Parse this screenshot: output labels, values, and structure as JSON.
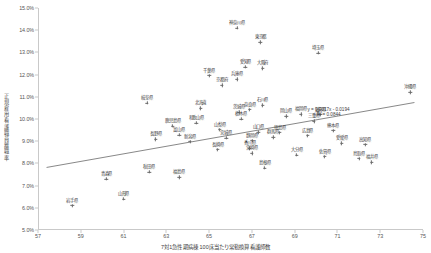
{
  "chart_data": {
    "type": "scatter",
    "title": "",
    "xlabel": "7対1急性期病棟 100床当たり常勤換算看護師数",
    "ylabel": "正規雇用看護職員離職率",
    "xlim": [
      57,
      75
    ],
    "ylim": [
      0.05,
      0.15
    ],
    "xticks": [
      "57",
      "59",
      "61",
      "63",
      "65",
      "67",
      "69",
      "71",
      "73",
      "75"
    ],
    "xtick_values": [
      57,
      59,
      61,
      63,
      65,
      67,
      69,
      71,
      73,
      75
    ],
    "yticks": [
      "5.0%",
      "6.0%",
      "7.0%",
      "8.0%",
      "9.0%",
      "10.0%",
      "11.0%",
      "12.0%",
      "13.0%",
      "14.0%",
      "15.0%"
    ],
    "ytick_values": [
      0.05,
      0.06,
      0.07,
      0.08,
      0.09,
      0.1,
      0.11,
      0.12,
      0.13,
      0.14,
      0.15
    ],
    "grid": false,
    "legend": "none",
    "marker": "cross",
    "marker_color": "#6b6b6b",
    "trendline": {
      "equation": "y = 0.0017x - 0.0194",
      "r_squared": "R² = 0.0844",
      "slope": 0.0017,
      "intercept": -0.0194,
      "color": "#555555",
      "x_start": 57.4,
      "x_end": 74.6
    },
    "points": [
      {
        "label": "神奈川県",
        "x": 66.3,
        "y": 0.141
      },
      {
        "label": "東京都",
        "x": 67.4,
        "y": 0.1345
      },
      {
        "label": "埼玉県",
        "x": 70.1,
        "y": 0.1298
      },
      {
        "label": "愛知県",
        "x": 66.7,
        "y": 0.1235
      },
      {
        "label": "大阪府",
        "x": 67.5,
        "y": 0.1228
      },
      {
        "label": "千葉県",
        "x": 65.0,
        "y": 0.1195
      },
      {
        "label": "兵庫県",
        "x": 66.3,
        "y": 0.1178
      },
      {
        "label": "京都府",
        "x": 65.6,
        "y": 0.1152
      },
      {
        "label": "沖縄県",
        "x": 74.4,
        "y": 0.112
      },
      {
        "label": "岐阜県",
        "x": 62.1,
        "y": 0.1072
      },
      {
        "label": "石川県",
        "x": 67.5,
        "y": 0.1062
      },
      {
        "label": "北海道",
        "x": 64.6,
        "y": 0.1048
      },
      {
        "label": "奈良県",
        "x": 66.9,
        "y": 0.1042
      },
      {
        "label": "茨城県",
        "x": 66.4,
        "y": 0.103
      },
      {
        "label": "福岡県",
        "x": 69.3,
        "y": 0.1022
      },
      {
        "label": "滋賀県",
        "x": 70.2,
        "y": 0.102
      },
      {
        "label": "岡山県",
        "x": 68.6,
        "y": 0.1012
      },
      {
        "label": "栃木県",
        "x": 66.5,
        "y": 0.1
      },
      {
        "label": "三重県",
        "x": 69.9,
        "y": 0.099
      },
      {
        "label": "和歌山県",
        "x": 64.4,
        "y": 0.0982
      },
      {
        "label": "鹿児島県",
        "x": 63.3,
        "y": 0.0968
      },
      {
        "label": "山梨県",
        "x": 65.5,
        "y": 0.0952
      },
      {
        "label": "熊本県",
        "x": 70.8,
        "y": 0.0948
      },
      {
        "label": "山口県",
        "x": 67.3,
        "y": 0.094
      },
      {
        "label": "徳島県",
        "x": 68.3,
        "y": 0.0938
      },
      {
        "label": "富山県",
        "x": 63.6,
        "y": 0.0928
      },
      {
        "label": "広島県",
        "x": 69.6,
        "y": 0.0925
      },
      {
        "label": "群馬県",
        "x": 68.0,
        "y": 0.0918
      },
      {
        "label": "宮城県",
        "x": 65.8,
        "y": 0.0915
      },
      {
        "label": "長野県",
        "x": 62.5,
        "y": 0.0908
      },
      {
        "label": "静岡県",
        "x": 67.0,
        "y": 0.0902
      },
      {
        "label": "新潟県",
        "x": 64.1,
        "y": 0.0898
      },
      {
        "label": "愛媛県",
        "x": 71.2,
        "y": 0.089
      },
      {
        "label": "高知県",
        "x": 72.3,
        "y": 0.0885
      },
      {
        "label": "香川県",
        "x": 66.9,
        "y": 0.0868
      },
      {
        "label": "長崎県",
        "x": 65.4,
        "y": 0.0862
      },
      {
        "label": "宮崎県",
        "x": 67.0,
        "y": 0.0845
      },
      {
        "label": "大分県",
        "x": 69.1,
        "y": 0.0838
      },
      {
        "label": "佐賀県",
        "x": 70.4,
        "y": 0.083
      },
      {
        "label": "鳥取県",
        "x": 72.0,
        "y": 0.0822
      },
      {
        "label": "福井県",
        "x": 72.6,
        "y": 0.0805
      },
      {
        "label": "島根県",
        "x": 67.6,
        "y": 0.078
      },
      {
        "label": "秋田県",
        "x": 62.2,
        "y": 0.0762
      },
      {
        "label": "福島県",
        "x": 63.6,
        "y": 0.0738
      },
      {
        "label": "青森県",
        "x": 60.2,
        "y": 0.073
      },
      {
        "label": "山形県",
        "x": 61.0,
        "y": 0.064
      },
      {
        "label": "岩手県",
        "x": 58.6,
        "y": 0.061
      }
    ]
  }
}
